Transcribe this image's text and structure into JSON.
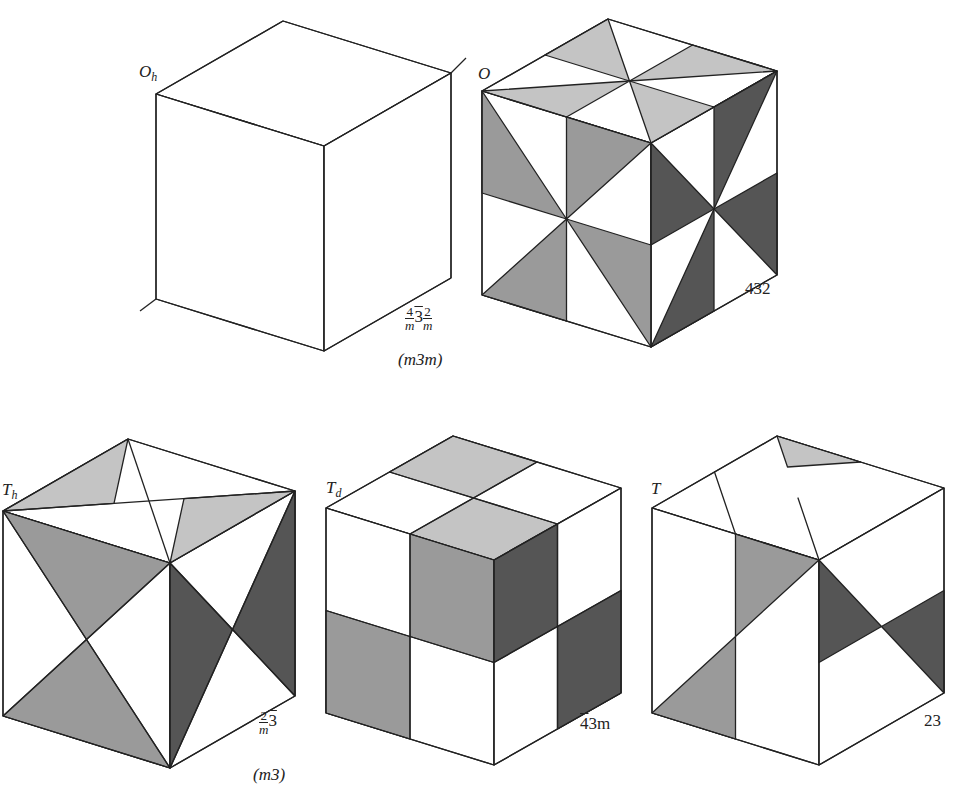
{
  "figure": {
    "colors": {
      "light": "#c4c4c4",
      "medium": "#9a9a9a",
      "dark": "#555555",
      "white": "#ffffff",
      "edge": "#222222"
    },
    "cubes": [
      {
        "id": "Oh",
        "schoenflies": "O",
        "schoenflies_sub": "h",
        "hm_parts": [
          "4",
          "m",
          "3",
          "2",
          "m"
        ],
        "hm_full": "4/m 3̄ 2/m",
        "hm_short": "(m3m)",
        "F": [
          324,
          146
        ],
        "a": [
          -168,
          -52
        ],
        "b": [
          127,
          -73
        ],
        "c": [
          0,
          205
        ],
        "stubs": true,
        "faces": []
      },
      {
        "id": "O",
        "schoenflies": "O",
        "schoenflies_sub": "",
        "hm_full": "432",
        "hm_short": "",
        "F": [
          651,
          143
        ],
        "a": [
          -169,
          -52
        ],
        "b": [
          126,
          -72
        ],
        "c": [
          0,
          204
        ],
        "stubs": false,
        "faces": [
          {
            "face": "top",
            "pts": [
              [
                1,
                0
              ],
              [
                0.5,
                0.5
              ],
              [
                0.5,
                0
              ]
            ],
            "tone": "light"
          },
          {
            "face": "top",
            "pts": [
              [
                0.5,
                0
              ],
              [
                0.5,
                0.5
              ],
              [
                0.5,
                0
              ]
            ],
            "tone": "light"
          },
          {
            "face": "top",
            "pts": [
              [
                0,
                0.5
              ],
              [
                0.5,
                0.5
              ],
              [
                0,
                0
              ]
            ],
            "tone": "light"
          },
          {
            "face": "top",
            "pts": [
              [
                1,
                1
              ],
              [
                0.5,
                0.5
              ],
              [
                1,
                0.5
              ]
            ],
            "tone": "light"
          },
          {
            "face": "top",
            "pts": [
              [
                0.5,
                1
              ],
              [
                0.5,
                0.5
              ],
              [
                1,
                1
              ]
            ],
            "tone": "light"
          },
          {
            "face": "top",
            "pts": [
              [
                1,
                0
              ],
              [
                0.5,
                0.5
              ],
              [
                0.5,
                0
              ]
            ],
            "tone": "light"
          }
        ]
      },
      {
        "id": "Th",
        "schoenflies": "T",
        "schoenflies_sub": "h",
        "hm_parts": [
          "2",
          "m",
          "3"
        ],
        "hm_full": "2/m 3̄",
        "hm_short": "(m3)",
        "F": [
          170,
          563
        ],
        "a": [
          -167,
          -52
        ],
        "b": [
          125,
          -72
        ],
        "c": [
          0,
          205
        ],
        "stubs": false,
        "faces": []
      },
      {
        "id": "Td",
        "schoenflies": "T",
        "schoenflies_sub": "d",
        "hm_full": "4̄3m",
        "hm_short": "",
        "F": [
          494,
          560
        ],
        "a": [
          -168,
          -52
        ],
        "b": [
          127,
          -72
        ],
        "c": [
          0,
          205
        ],
        "stubs": false,
        "faces": []
      },
      {
        "id": "T",
        "schoenflies": "T",
        "schoenflies_sub": "",
        "hm_full": "23",
        "hm_short": "",
        "F": [
          819,
          560
        ],
        "a": [
          -167,
          -52
        ],
        "b": [
          125,
          -72
        ],
        "c": [
          0,
          205
        ],
        "stubs": false,
        "faces": []
      }
    ],
    "labels": {
      "oh": {
        "main": "O",
        "sub": "h"
      },
      "o": {
        "main": "O"
      },
      "th": {
        "main": "T",
        "sub": "h"
      },
      "td": {
        "main": "T",
        "sub": "d"
      },
      "t": {
        "main": "T"
      },
      "oh_sym_f1_num": "4",
      "oh_sym_f1_den": "m",
      "oh_sym_mid": "3",
      "oh_sym_f2_num": "2",
      "oh_sym_f2_den": "m",
      "oh_short": "(m3m)",
      "o_sym": "432",
      "th_sym_f_num": "2",
      "th_sym_f_den": "m",
      "th_sym_mid": "3",
      "th_short": "(m3)",
      "td_sym_bar": "4",
      "td_sym_rest": "3m",
      "t_sym": "23"
    }
  }
}
